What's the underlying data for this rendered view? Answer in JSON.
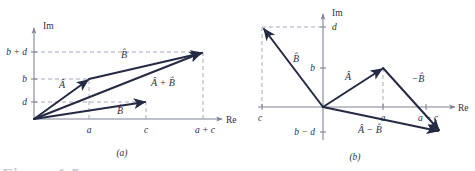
{
  "figure": {
    "caption_partial": "Figure 1.5",
    "panels": [
      {
        "id": "a",
        "label": "(a)",
        "axes": {
          "x_label": "Re",
          "y_label": "Im"
        },
        "x_ticks": [
          {
            "label": "a",
            "value": 1
          },
          {
            "label": "c",
            "value": 2
          },
          {
            "label": "a + c",
            "value": 3
          }
        ],
        "y_ticks": [
          {
            "label": "d",
            "value": 1
          },
          {
            "label": "b",
            "value": 2
          },
          {
            "label": "b + d",
            "value": 3
          }
        ],
        "vectors": [
          {
            "label": "Â",
            "from": "origin",
            "to": "(a, b)"
          },
          {
            "label": "B̂",
            "from": "(a, b)",
            "to": "(a + c, b + d)"
          },
          {
            "label": "Â + B̂",
            "from": "origin",
            "to": "(a + c, b + d)"
          },
          {
            "label": "B̂",
            "from": "origin",
            "to": "(c, d)"
          }
        ]
      },
      {
        "id": "b",
        "label": "(b)",
        "axes": {
          "x_label": "Re",
          "y_label": "Im"
        },
        "x_ticks": [
          {
            "label": "c",
            "value": -1
          },
          {
            "label": "a",
            "value": 1
          },
          {
            "label": "a − c",
            "value": 2
          }
        ],
        "y_ticks": [
          {
            "label": "d",
            "value": 2
          },
          {
            "label": "b",
            "value": 1
          },
          {
            "label": "b − d",
            "value": -1
          }
        ],
        "vectors": [
          {
            "label": "B̂",
            "from": "origin",
            "to": "(c, d)"
          },
          {
            "label": "Â",
            "from": "origin",
            "to": "(a, b)"
          },
          {
            "label": "−B̂",
            "from": "(a, b)",
            "to": "(a − c, b − d)"
          },
          {
            "label": "Â − B̂",
            "from": "origin",
            "to": "(a − c, b − d)"
          }
        ]
      }
    ]
  },
  "labels": {
    "im": "Im",
    "re": "Re",
    "a_bpd": "b + d",
    "a_b": "b",
    "a_d": "d",
    "a_a": "a",
    "a_c": "c",
    "a_apc": "a + c",
    "a_vecA": "Â",
    "a_vecB_upper": "B̂",
    "a_vecB_lower": "B̂",
    "a_vecAB": "Â + B̂",
    "a_panel": "(a)",
    "b_d": "d",
    "b_b": "b",
    "b_bmd": "b − d",
    "b_c": "c",
    "b_a": "a",
    "b_amc": "a − c",
    "b_vecB": "B̂",
    "b_vecA": "Â",
    "b_vecnegB": "−B̂",
    "b_vecAmB": "Â − B̂",
    "b_panel": "(b)"
  },
  "colors": {
    "vector": "#242a44",
    "axis": "#7f8496",
    "guide": "#9aa0b2",
    "background": "#ffffff",
    "caption_ghost": "#c9ccd6"
  }
}
